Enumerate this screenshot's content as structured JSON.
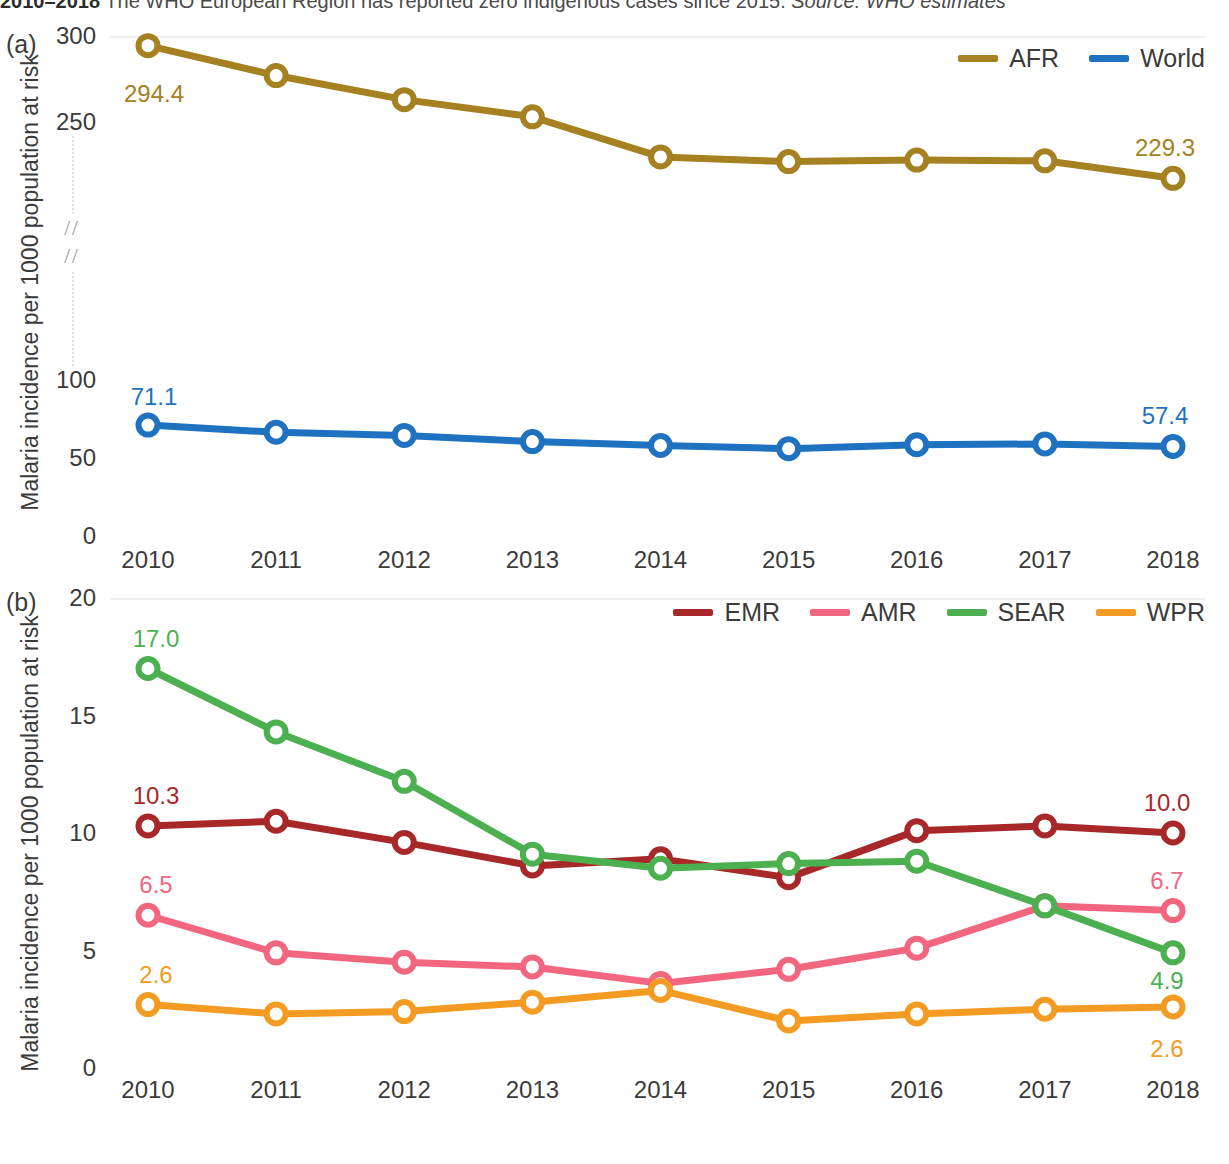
{
  "caption": {
    "years": "2010–2018",
    "text": " The WHO European Region has reported zero indigenous cases since 2015. ",
    "source_label": "Source:",
    "source_value": " WHO estimates"
  },
  "panels": {
    "a": {
      "letter": "(a)",
      "axis_title": "Malaria incidence per 1000 population at risk"
    },
    "b": {
      "letter": "(b)",
      "axis_title": "Malaria incidence per 1000 population at risk"
    }
  },
  "colors": {
    "AFR": "#a58122",
    "World": "#1f72bf",
    "EMR": "#a8282a",
    "AMR": "#f2667f",
    "SEAR": "#4cb050",
    "WPR": "#f39b23",
    "axis_text": "#3b3b3b",
    "baseline": "#efefef",
    "break_guide": "#dcdcdc"
  },
  "chart_data": [
    {
      "type": "line",
      "panel": "a",
      "title": "",
      "xlabel": "",
      "ylabel": "Malaria incidence per 1000 population at risk",
      "x": [
        2010,
        2011,
        2012,
        2013,
        2014,
        2015,
        2016,
        2017,
        2018
      ],
      "xtick_labels": [
        "2010",
        "2011",
        "2012",
        "2013",
        "2014",
        "2015",
        "2016",
        "2017",
        "2018"
      ],
      "ytick_labels": [
        "300",
        "250",
        "100",
        "50",
        "0"
      ],
      "ytick_values": [
        300,
        250,
        100,
        50,
        0
      ],
      "ylim": [
        0,
        300
      ],
      "axis_break": {
        "between": [
          250,
          100
        ],
        "marker": "//"
      },
      "grid": false,
      "legend_position": "top-right",
      "series": [
        {
          "name": "AFR",
          "color": "#a58122",
          "values": [
            294.4,
            277.0,
            263.0,
            253.0,
            243.0,
            240.0,
            241.0,
            240.5,
            229.3
          ],
          "start_label": "294.4",
          "end_label": "229.3"
        },
        {
          "name": "World",
          "color": "#1f72bf",
          "values": [
            71.1,
            66.5,
            64.5,
            60.5,
            58.0,
            56.0,
            58.5,
            59.0,
            57.4
          ],
          "start_label": "71.1",
          "end_label": "57.4"
        }
      ]
    },
    {
      "type": "line",
      "panel": "b",
      "title": "",
      "xlabel": "",
      "ylabel": "Malaria incidence per 1000 population at risk",
      "x": [
        2010,
        2011,
        2012,
        2013,
        2014,
        2015,
        2016,
        2017,
        2018
      ],
      "xtick_labels": [
        "2010",
        "2011",
        "2012",
        "2013",
        "2014",
        "2015",
        "2016",
        "2017",
        "2018"
      ],
      "ytick_labels": [
        "20",
        "15",
        "10",
        "5",
        "0"
      ],
      "ytick_values": [
        20,
        15,
        10,
        5,
        0
      ],
      "ylim": [
        0,
        20
      ],
      "grid": false,
      "legend_position": "top-right",
      "series": [
        {
          "name": "EMR",
          "color": "#a8282a",
          "values": [
            10.3,
            10.5,
            9.6,
            8.6,
            8.9,
            8.1,
            10.1,
            10.3,
            10.0
          ],
          "start_label": "10.3",
          "end_label": "10.0"
        },
        {
          "name": "AMR",
          "color": "#f2667f",
          "values": [
            6.5,
            4.9,
            4.5,
            4.3,
            3.6,
            4.2,
            5.1,
            6.9,
            6.7
          ],
          "start_label": "6.5",
          "end_label": "6.7"
        },
        {
          "name": "SEAR",
          "color": "#4cb050",
          "values": [
            17.0,
            14.3,
            12.2,
            9.1,
            8.5,
            8.7,
            8.8,
            6.9,
            4.9
          ],
          "start_label": "17.0",
          "end_label": "4.9"
        },
        {
          "name": "WPR",
          "color": "#f39b23",
          "values": [
            2.7,
            2.3,
            2.4,
            2.8,
            3.3,
            2.0,
            2.3,
            2.5,
            2.6
          ],
          "start_label": "2.6",
          "end_label": "2.6"
        }
      ]
    }
  ]
}
